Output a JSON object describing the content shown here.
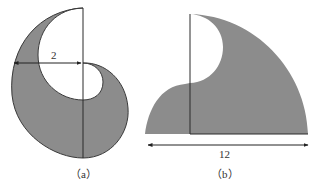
{
  "figures": [
    {
      "id": "a",
      "caption": "（a）",
      "dimension_label": "2",
      "description": "Shaded crescent/spiral-like region bounded by semicircular arcs with a vertical diameter line"
    },
    {
      "id": "b",
      "caption": "（b）",
      "dimension_label": "12",
      "description": "Shaded quarter-circle-like region with a white semicircular notch and a left hump"
    }
  ],
  "colors": {
    "fill": "#8c8c8c",
    "stroke": "#3a3a3a",
    "background": "#ffffff"
  }
}
